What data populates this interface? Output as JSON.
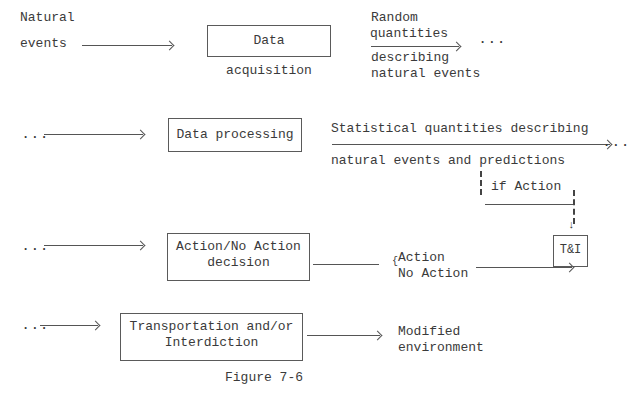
{
  "diagram": {
    "row1": {
      "input_label_line1": "Natural",
      "input_label_line2": "events",
      "box": "Data acquisition",
      "output_above_line1": "Random",
      "output_above_line2": "quantities",
      "output_below_line1": "describing",
      "output_below_line2": "natural events",
      "continuation": "..."
    },
    "row2": {
      "lead": "...",
      "box": "Data processing",
      "output_above": "Statistical quantities describing",
      "output_below": "natural events and predictions",
      "continuation": "...",
      "branch_label": "if Action"
    },
    "row3": {
      "lead": "...",
      "box_line1": "Action/No Action",
      "box_line2": "decision",
      "option1": "Action",
      "option2": "No Action",
      "brace": "{",
      "target_box": "T&I"
    },
    "row4": {
      "lead": "...",
      "box_line1": "Transportation and/or",
      "box_line2": "Interdiction",
      "output_line1": "Modified",
      "output_line2": "environment"
    },
    "caption": "Figure 7-6"
  }
}
